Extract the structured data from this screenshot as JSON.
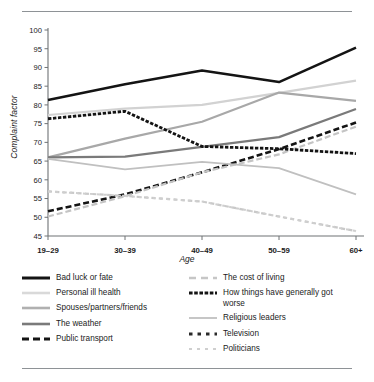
{
  "chart_data": {
    "type": "line",
    "title": "",
    "xlabel": "Age",
    "ylabel": "Complaint factor",
    "categories": [
      "19–29",
      "30–39",
      "40–49",
      "50–59",
      "60+"
    ],
    "ylim": [
      45,
      100
    ],
    "yticks": [
      45,
      50,
      55,
      60,
      65,
      70,
      75,
      80,
      85,
      90,
      95,
      100
    ],
    "grid": false,
    "legend_position": "bottom",
    "series": [
      {
        "name": "Bad luck or fate",
        "values": [
          81.3,
          85.5,
          89.2,
          86.1,
          95.3
        ],
        "color": "#141414",
        "width": 2.6,
        "dash": "none"
      },
      {
        "name": "Personal ill health",
        "values": [
          77.3,
          79.0,
          80.0,
          83.2,
          86.5
        ],
        "color": "#d2d2d2",
        "width": 2.2,
        "dash": "none"
      },
      {
        "name": "Spouses/partners/friends",
        "values": [
          66.0,
          71.0,
          75.5,
          83.3,
          81.1
        ],
        "color": "#a8a8a8",
        "width": 2.2,
        "dash": "none"
      },
      {
        "name": "The weather",
        "values": [
          66.0,
          66.2,
          68.8,
          71.4,
          78.9
        ],
        "color": "#7a7a7a",
        "width": 2.2,
        "dash": "none"
      },
      {
        "name": "Public transport",
        "values": [
          51.6,
          56.1,
          62.0,
          68.2,
          75.3
        ],
        "color": "#141414",
        "width": 2.6,
        "dash": "6,3"
      },
      {
        "name": "The cost of living",
        "values": [
          50.2,
          55.6,
          62.0,
          66.8,
          74.2
        ],
        "color": "#c4c4c4",
        "width": 2.2,
        "dash": "6,3"
      },
      {
        "name": "How things have generally got worse",
        "values": [
          76.3,
          78.3,
          68.9,
          68.3,
          67.0
        ],
        "color": "#141414",
        "width": 2.8,
        "dash": "3.4,1.6"
      },
      {
        "name": "Religious leaders",
        "values": [
          65.6,
          62.8,
          64.8,
          63.1,
          56.1
        ],
        "color": "#c0c0c0",
        "width": 1.8,
        "dash": "none"
      },
      {
        "name": "Television",
        "values": [
          56.9,
          55.7,
          54.2,
          50.2,
          46.3
        ],
        "color": "#c9c9c9",
        "width": 2.2,
        "dash": "4,3.4"
      },
      {
        "name": "Politicians",
        "values": [
          56.9,
          55.7,
          54.2,
          50.2,
          46.3
        ],
        "color": "#cfcfcf",
        "width": 2.0,
        "dash": "3,4"
      }
    ]
  },
  "legend": {
    "left_column": [
      {
        "label": "Bad luck or fate",
        "color": "#141414",
        "width": 3.0,
        "dash": "none"
      },
      {
        "label": "Personal ill health",
        "color": "#d9d9d9",
        "width": 2.6,
        "dash": "none"
      },
      {
        "label": "Spouses/partners/friends",
        "color": "#b0b0b0",
        "width": 2.6,
        "dash": "none"
      },
      {
        "label": "The weather",
        "color": "#7a7a7a",
        "width": 2.6,
        "dash": "none"
      },
      {
        "label": "Public transport",
        "color": "#141414",
        "width": 3.2,
        "dash": "7,4"
      }
    ],
    "right_column": [
      {
        "label": "The cost of living",
        "color": "#c6c6c6",
        "width": 2.4,
        "dash": "7,5"
      },
      {
        "label": "How things have generally got worse",
        "color": "#141414",
        "width": 3.2,
        "dash": "3.6,1.6"
      },
      {
        "label": "Religious leaders",
        "color": "#c6c6c6",
        "width": 2.0,
        "dash": "none"
      },
      {
        "label": "Television",
        "color": "#2a2a2a",
        "width": 3.0,
        "dash": "3.5,5"
      },
      {
        "label": "Politicians",
        "color": "#cfcfcf",
        "width": 2.2,
        "dash": "3,5"
      }
    ]
  }
}
